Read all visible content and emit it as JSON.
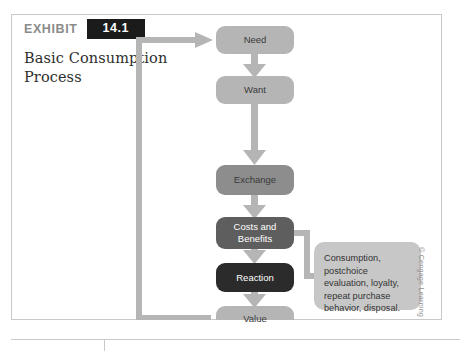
{
  "exhibit": {
    "kicker": "EXHIBIT",
    "number": "14.1",
    "title": "Basic Consumption Process"
  },
  "credit": {
    "text": "© Cengage Learning"
  },
  "diagram": {
    "type": "flowchart",
    "nodes": [
      {
        "id": "need",
        "label": "Need",
        "fill": "#b5b5b5",
        "text_color": "#3a3a3a"
      },
      {
        "id": "want",
        "label": "Want",
        "fill": "#b5b5b5",
        "text_color": "#3a3a3a"
      },
      {
        "id": "exchange",
        "label": "Exchange",
        "fill": "#8d8d8d",
        "text_color": "#3a3a3a"
      },
      {
        "id": "costs",
        "label": "Costs and Benefits",
        "fill": "#5e5e5e",
        "text_color": "#ffffff"
      },
      {
        "id": "reaction",
        "label": "Reaction",
        "fill": "#2b2b2b",
        "text_color": "#ffffff"
      },
      {
        "id": "value",
        "label": "Value",
        "fill": "#b5b5b5",
        "text_color": "#3a3a3a"
      }
    ],
    "callout": {
      "id": "callout",
      "label": "Consumption, postchoice evaluation, loyalty, repeat purchase behavior, disposal.",
      "fill": "#c7c7c7",
      "text_color": "#333333"
    },
    "connectors": [
      {
        "from": "need",
        "to": "want",
        "kind": "arrow-down"
      },
      {
        "from": "want",
        "to": "exchange",
        "kind": "arrow-down-long"
      },
      {
        "from": "exchange",
        "to": "costs",
        "kind": "arrow-down"
      },
      {
        "from": "costs",
        "to": "reaction",
        "kind": "arrow-down"
      },
      {
        "from": "reaction",
        "to": "value",
        "kind": "arrow-down"
      },
      {
        "from": "value",
        "to": "need",
        "kind": "feedback-loop-left"
      },
      {
        "from": "costs",
        "to": "callout",
        "kind": "bracket-right"
      }
    ],
    "colors": {
      "connector": "#b5b5b5",
      "frame_border": "#c9c9c9",
      "badge_bg": "#1b1b1b",
      "kicker": "#8b8b8b",
      "title": "#2e2e2e"
    }
  }
}
